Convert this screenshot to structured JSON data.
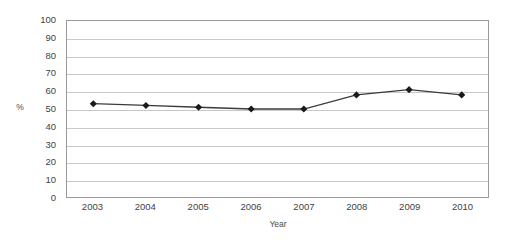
{
  "chart_data": {
    "type": "line",
    "title": "",
    "subtitle": "",
    "xlabel": "Year",
    "ylabel": "%",
    "categories": [
      "2003",
      "2004",
      "2005",
      "2006",
      "2007",
      "2008",
      "2009",
      "2010"
    ],
    "x": [
      2003,
      2004,
      2005,
      2006,
      2007,
      2008,
      2009,
      2010
    ],
    "values": [
      53,
      52,
      51,
      50,
      50,
      58,
      61,
      58
    ],
    "series": [
      {
        "name": "",
        "values": [
          53,
          52,
          51,
          50,
          50,
          58,
          61,
          58
        ],
        "marker": "diamond",
        "marker_color": "#1a1a1a",
        "line_color": "#3b3b3b"
      }
    ],
    "ylim": [
      0,
      100
    ],
    "ytick_labels": [
      "100",
      "90",
      "80",
      "70",
      "60",
      "50",
      "40",
      "30",
      "20",
      "10",
      "0"
    ],
    "ytick_values": [
      100,
      90,
      80,
      70,
      60,
      50,
      40,
      30,
      20,
      10,
      0
    ],
    "ytick_step": 10,
    "grid": true,
    "grid_axis": "y",
    "grid_color": "#c8c8c8",
    "legend": false,
    "legend_position": "none",
    "plot_border_color": "#9a9a9a",
    "background_color": "#ffffff",
    "annotations": []
  }
}
